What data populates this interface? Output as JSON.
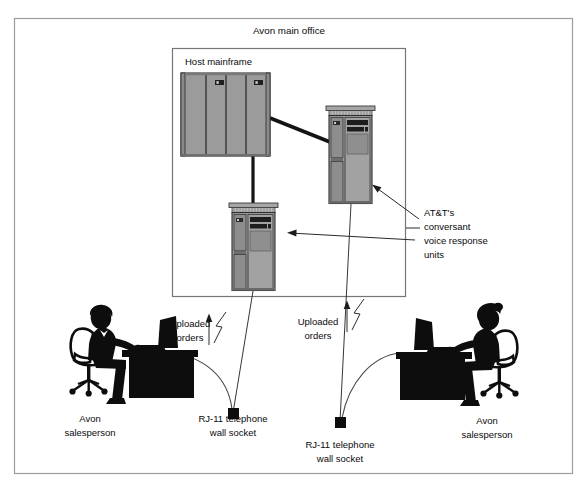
{
  "figure": {
    "type": "network-architecture-diagram",
    "background_color": "#ffffff",
    "outer_frame_color": "#9a9a9a",
    "inner_frame_color": "#6e6e6e",
    "equipment_fill": "#9b9b9b",
    "equipment_fill_light": "#b4b4b4",
    "equipment_fill_dark": "#5a5a5a",
    "silhouette_color": "#0d0d0d",
    "line_color": "#1a1a1a"
  },
  "labels": {
    "office_title": "Avon main office",
    "mainframe": "Host mainframe",
    "voice_units_line1": "AT&T's",
    "voice_units_line2": "conversant",
    "voice_units_line3": "voice response",
    "voice_units_line4": "units",
    "uploaded_left_line1": "Uploaded",
    "uploaded_left_line2": "orders",
    "uploaded_right_line1": "Uploaded",
    "uploaded_right_line2": "orders",
    "socket_left_line1": "RJ-11 telephone",
    "socket_left_line2": "wall socket",
    "socket_right_line1": "RJ-11 telephone",
    "socket_right_line2": "wall socket",
    "salesperson_left_line1": "Avon",
    "salesperson_left_line2": "salesperson",
    "salesperson_right_line1": "Avon",
    "salesperson_right_line2": "salesperson"
  },
  "nodes": [
    {
      "id": "host-mainframe",
      "label": "Host mainframe",
      "kind": "mainframe",
      "panels": 4,
      "indicators": 2
    },
    {
      "id": "voice-unit-upper",
      "label": "AT&T's conversant voice response unit",
      "kind": "voice-response-unit"
    },
    {
      "id": "voice-unit-lower",
      "label": "AT&T's conversant voice response unit",
      "kind": "voice-response-unit"
    },
    {
      "id": "rj11-socket-left",
      "label": "RJ-11 telephone wall socket",
      "kind": "wall-socket"
    },
    {
      "id": "rj11-socket-right",
      "label": "RJ-11 telephone wall socket",
      "kind": "wall-socket"
    },
    {
      "id": "salesperson-left",
      "label": "Avon salesperson",
      "kind": "person-at-desk"
    },
    {
      "id": "salesperson-right",
      "label": "Avon salesperson",
      "kind": "person-at-desk"
    }
  ],
  "connections": [
    {
      "from": "host-mainframe",
      "to": "voice-unit-upper",
      "style": "thick-cable"
    },
    {
      "from": "host-mainframe",
      "to": "voice-unit-lower",
      "style": "thick-cable"
    },
    {
      "from": "salesperson-left",
      "to": "rj11-socket-left",
      "style": "curved-phone-cord"
    },
    {
      "from": "salesperson-right",
      "to": "rj11-socket-right",
      "style": "curved-phone-cord"
    },
    {
      "from": "rj11-socket-left",
      "to": "voice-unit-lower",
      "style": "uploaded-orders-link"
    },
    {
      "from": "rj11-socket-right",
      "to": "voice-unit-upper",
      "style": "uploaded-orders-link"
    }
  ]
}
